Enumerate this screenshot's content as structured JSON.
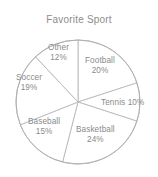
{
  "chart_data": {
    "type": "pie",
    "title": "Favorite Sport",
    "xlabel": "",
    "ylabel": "",
    "legend": "none",
    "grid": false,
    "value_suffix": "%",
    "start_angle_deg": 0,
    "direction": "clockwise",
    "categories": [
      "Football",
      "Tennis",
      "Basketball",
      "Baseball",
      "Soccer",
      "Other"
    ],
    "values": [
      20,
      10,
      24,
      15,
      19,
      12
    ],
    "slices": [
      {
        "name": "Football",
        "value": 20,
        "label": "Football",
        "percent_label": "20%",
        "color": "#ffffff",
        "stroke": "#b9b9b9",
        "label_layout": "stacked",
        "label_x": 85,
        "label_y": 56
      },
      {
        "name": "Tennis",
        "value": 10,
        "label": "Tennis",
        "percent_label": "10%",
        "color": "#ffffff",
        "stroke": "#b9b9b9",
        "label_layout": "inline",
        "label_x": 101,
        "label_y": 98
      },
      {
        "name": "Basketball",
        "value": 24,
        "label": "Basketball",
        "percent_label": "24%",
        "color": "#ffffff",
        "stroke": "#b9b9b9",
        "label_layout": "stacked",
        "label_x": 76,
        "label_y": 125
      },
      {
        "name": "Baseball",
        "value": 15,
        "label": "Baseball",
        "percent_label": "15%",
        "color": "#ffffff",
        "stroke": "#b9b9b9",
        "label_layout": "stacked",
        "label_x": 28,
        "label_y": 117
      },
      {
        "name": "Soccer",
        "value": 19,
        "label": "Soccer",
        "percent_label": "19%",
        "color": "#ffffff",
        "stroke": "#b9b9b9",
        "label_layout": "stacked",
        "label_x": 16,
        "label_y": 73
      },
      {
        "name": "Other",
        "value": 12,
        "label": "Other",
        "percent_label": "12%",
        "color": "#ffffff",
        "stroke": "#b9b9b9",
        "label_layout": "stacked",
        "label_x": 48,
        "label_y": 43
      }
    ],
    "geometry": {
      "center_x": 78,
      "center_y": 102,
      "radius": 62
    },
    "colors": {
      "background": "#ffffff",
      "title_text": "#8d8d8d",
      "label_text": "#8a8a8a",
      "slice_fill": "#ffffff",
      "slice_stroke": "#b9b9b9",
      "outline": "#b0b0b0"
    }
  }
}
